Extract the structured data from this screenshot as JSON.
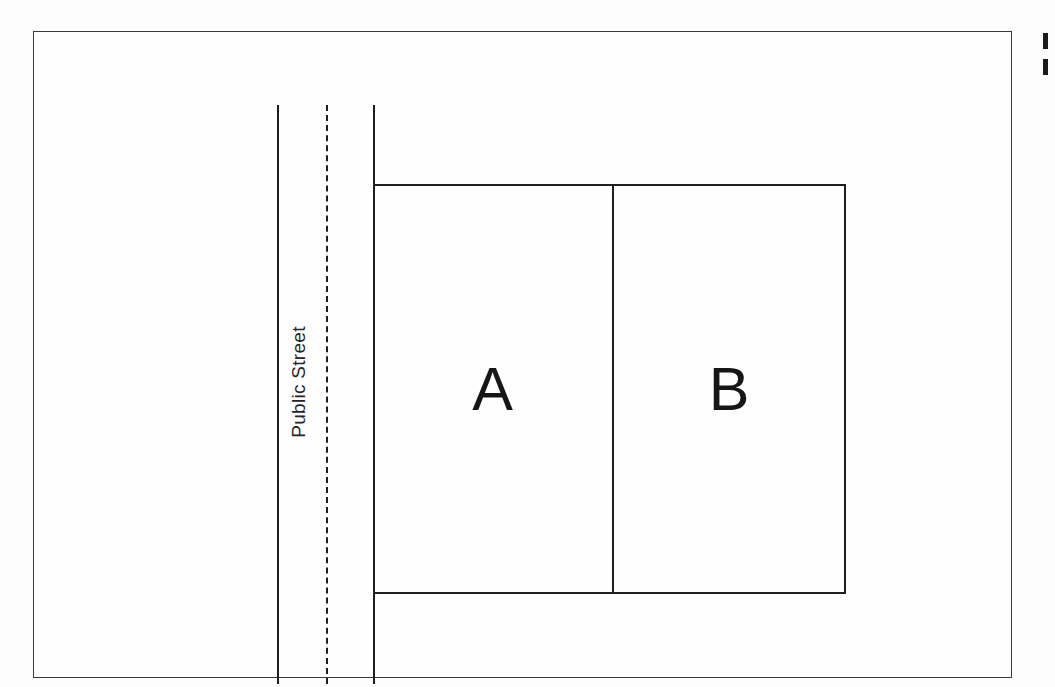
{
  "document": {
    "type": "plat-survey-diagram",
    "title": "Two-lot parcel plat fronting a public street",
    "background_color": "#fdfdfd",
    "ink_color": "#1f1f1f",
    "frame_color": "#3a3a3a"
  },
  "frame": {
    "name": "drawing-border",
    "x": 33,
    "y": 31,
    "width": 979,
    "height": 647
  },
  "street": {
    "label": "Public Street",
    "label_rotation_degrees": -90,
    "left_edge": {
      "x": 243,
      "y_top": 73,
      "y_bottom": 652,
      "style": "solid"
    },
    "center_line": {
      "x": 292,
      "y_top": 73,
      "y_bottom": 652,
      "style": "dashed"
    },
    "right_edge": {
      "x": 339,
      "y_top": 73,
      "y_bottom": 652,
      "style": "solid"
    }
  },
  "parcels": {
    "block": {
      "x": 339,
      "y": 152,
      "width": 473,
      "height": 410
    },
    "divider_x": 578,
    "lots": [
      {
        "label": "A",
        "x": 339,
        "y": 152,
        "width": 239,
        "height": 410
      },
      {
        "label": "B",
        "x": 578,
        "y": 152,
        "width": 234,
        "height": 410
      }
    ]
  },
  "margin_marks": {
    "description": "clipped ink marks at right page edge",
    "count": 2
  }
}
